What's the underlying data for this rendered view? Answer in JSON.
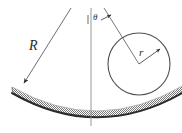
{
  "figure": {
    "background_color": "#ffffff",
    "line_color": "#4a4a4a",
    "arc_color": "#2f2f2f",
    "hatch_color": "#6e6e6e",
    "labels": {
      "radius_large": "R",
      "radius_small": "r",
      "angle": "θ"
    }
  },
  "elements": {
    "center_line": {
      "name": "vertical-center-line",
      "x": 91,
      "y1": 8,
      "y2": 126
    },
    "R_line": {
      "name": "radius-R-line",
      "x1": 71,
      "y1": 8,
      "x2": 22,
      "y2": 86,
      "arrow": "end"
    },
    "theta_line": {
      "name": "radius-to-ball-center-line",
      "x1": 104,
      "y1": 8,
      "x2": 139,
      "y2": 64
    },
    "theta_tick": {
      "name": "angle-tick-mark",
      "x": 88,
      "y1": 14,
      "y2": 23
    },
    "theta_arrow": {
      "name": "angle-arrow",
      "x1": 100,
      "y1": 19,
      "x2": 110,
      "y2": 15
    },
    "ball": {
      "name": "ball-circle",
      "cx": 139,
      "cy": 64,
      "r": 31
    },
    "r_arrow": {
      "name": "radius-r-arrow",
      "x1": 139,
      "y1": 64,
      "x2": 161,
      "y2": 48
    },
    "track": {
      "name": "concave-track-arc",
      "description": "shaded concave arc spanning the bottom of the figure",
      "x_start": 12,
      "x_end": 182,
      "lowest_y": 118
    }
  }
}
